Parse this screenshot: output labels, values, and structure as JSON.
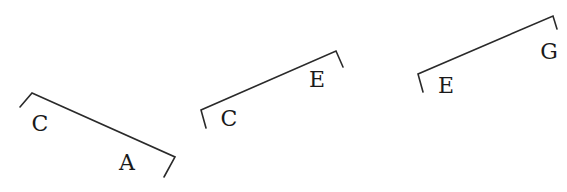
{
  "diagram": {
    "brackets": [
      {
        "id": "bracket-ca",
        "labels": [
          {
            "text": "C",
            "x": 40,
            "y": 131
          },
          {
            "text": "A",
            "x": 127,
            "y": 170
          }
        ],
        "path": "M20,107 L32,93 L175,157 L164,177"
      },
      {
        "id": "bracket-ce",
        "labels": [
          {
            "text": "C",
            "x": 229,
            "y": 126
          },
          {
            "text": "E",
            "x": 317,
            "y": 87
          }
        ],
        "path": "M206,128 L201,110 L336,51 L343,67"
      },
      {
        "id": "bracket-eg",
        "labels": [
          {
            "text": "E",
            "x": 446,
            "y": 93
          },
          {
            "text": "G",
            "x": 549,
            "y": 59
          }
        ],
        "path": "M423,92 L418,74 L553,16 L557,29"
      }
    ]
  }
}
